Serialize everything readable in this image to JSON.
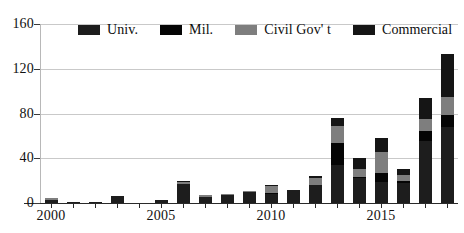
{
  "chart_data": {
    "type": "bar",
    "stacked": true,
    "title": "",
    "subtitle": "",
    "xlabel": "",
    "ylabel": "",
    "ylim": [
      0,
      160
    ],
    "yticks": [
      0,
      40,
      80,
      120,
      160
    ],
    "xticks": [
      "2000",
      "2005",
      "2010",
      "2015"
    ],
    "grid": true,
    "legend_position": "top-inside",
    "categories": [
      "2000",
      "2001",
      "2002",
      "2003",
      "2004",
      "2005",
      "2006",
      "2007",
      "2008",
      "2009",
      "2010",
      "2011",
      "2012",
      "2013",
      "2014",
      "2015",
      "2016",
      "2017",
      "2018"
    ],
    "series": [
      {
        "name": "Univ.",
        "color": "#1d1d1d",
        "values": [
          3,
          1,
          1,
          6,
          0,
          3,
          17,
          5,
          7,
          10,
          8,
          12,
          16,
          34,
          22,
          19,
          18,
          55,
          68
        ]
      },
      {
        "name": "Mil.",
        "color": "#050505",
        "values": [
          0,
          0,
          0,
          0,
          0,
          0,
          0,
          0,
          0,
          0,
          1,
          0,
          0,
          20,
          1,
          8,
          2,
          9,
          11
        ]
      },
      {
        "name": "Civil Gov' t",
        "color": "#7e7e7e",
        "values": [
          1,
          0,
          0,
          0,
          0,
          0,
          2,
          2,
          1,
          1,
          6,
          0,
          6,
          15,
          7,
          19,
          5,
          11,
          16
        ]
      },
      {
        "name": "Commercial",
        "color": "#151515",
        "values": [
          0,
          0,
          0,
          0,
          0,
          0,
          1,
          0,
          0,
          0,
          1,
          0,
          2,
          7,
          10,
          12,
          5,
          19,
          38
        ]
      }
    ],
    "totals": [
      4,
      1,
      1,
      6,
      0,
      3,
      20,
      7,
      8,
      11,
      16,
      12,
      24,
      76,
      40,
      58,
      30,
      94,
      133
    ]
  },
  "axis": {
    "y_tick_labels": [
      "160",
      "120",
      "80",
      "40",
      "0"
    ],
    "x_tick_labels": [
      "2000",
      "2005",
      "2010",
      "2015"
    ]
  },
  "legend": {
    "items": [
      {
        "label": "Univ.",
        "color": "#1d1d1d"
      },
      {
        "label": "Mil.",
        "color": "#050505"
      },
      {
        "label": "Civil Gov' t",
        "color": "#7e7e7e"
      },
      {
        "label": "Commercial",
        "color": "#151515"
      }
    ]
  }
}
